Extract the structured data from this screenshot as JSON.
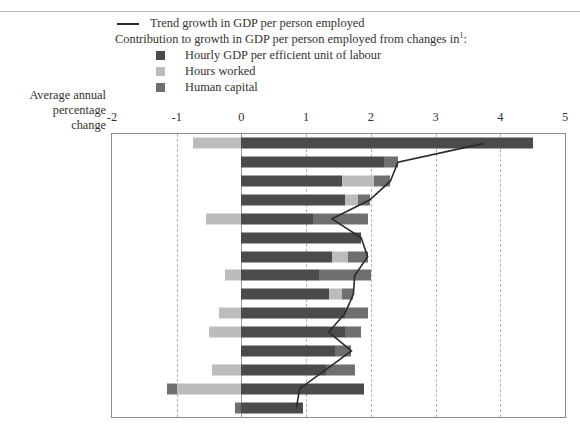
{
  "legend": {
    "line_label": "Trend growth in GDP per person employed",
    "heading": "Contribution to growth in GDP per person employed from changes in",
    "heading_sup": "1",
    "heading_colon": ":",
    "items": [
      {
        "label": "Hourly GDP per efficient unit of labour",
        "color": "#4b4b49",
        "key": "hourly_gdp"
      },
      {
        "label": "Hours worked",
        "color": "#bcbcba",
        "key": "hours_worked"
      },
      {
        "label": "Human capital",
        "color": "#6f6f6d",
        "key": "human_capital"
      }
    ]
  },
  "axis_corner": {
    "line1": "Average annual",
    "line2": "percentage",
    "line3": "change"
  },
  "colors": {
    "hourly_gdp": "#4b4b49",
    "hours_worked": "#bcbcba",
    "human_capital": "#6f6f6d",
    "trend_line": "#2a2a28",
    "frame": "#8e8c88",
    "grid": "#b6b4b0"
  },
  "chart_data": {
    "type": "bar",
    "title": "",
    "subtitle": "",
    "xlabel": "Average annual percentage change",
    "ylabel": "",
    "xlim": [
      -2,
      5
    ],
    "xticks": [
      -2,
      -1,
      0,
      1,
      2,
      3,
      4,
      5
    ],
    "grid": true,
    "orientation": "horizontal",
    "stacked": true,
    "legend_position": "top",
    "categories": [
      "Ireland",
      "Finland",
      "Sweden",
      "Denmark",
      "Portugal",
      "Australia",
      "United States",
      "United Kingdom",
      "Italy",
      "Norway",
      "Germany",
      "Canada",
      "France",
      "Netherlands",
      "New Zealand"
    ],
    "category_footnotes": {
      "Ireland": "2",
      "Norway": "3",
      "Germany": "4"
    },
    "series": [
      {
        "name": "Hourly GDP per efficient unit of labour",
        "key": "hourly_gdp",
        "color": "#4b4b49",
        "values": [
          4.5,
          2.2,
          1.55,
          1.6,
          1.1,
          1.85,
          1.4,
          1.2,
          1.35,
          1.6,
          1.6,
          1.45,
          1.3,
          1.9,
          0.95
        ]
      },
      {
        "name": "Hours worked",
        "key": "hours_worked",
        "color": "#bcbcba",
        "values": [
          -0.75,
          0.0,
          0.5,
          0.2,
          -0.55,
          0.0,
          0.25,
          -0.25,
          0.2,
          -0.35,
          -0.5,
          0.0,
          -0.45,
          -1.0,
          0.0
        ]
      },
      {
        "name": "Human capital",
        "key": "human_capital",
        "color": "#6f6f6d",
        "values": [
          0.0,
          0.22,
          0.25,
          0.18,
          0.85,
          0.0,
          0.3,
          0.8,
          0.18,
          0.35,
          0.25,
          0.25,
          0.45,
          -0.15,
          -0.1
        ]
      }
    ],
    "trend_line": {
      "name": "Trend growth in GDP per person employed",
      "values": [
        3.75,
        2.42,
        2.3,
        1.98,
        1.4,
        1.85,
        1.95,
        1.75,
        1.73,
        1.6,
        1.35,
        1.7,
        1.3,
        0.9,
        0.85
      ]
    }
  }
}
